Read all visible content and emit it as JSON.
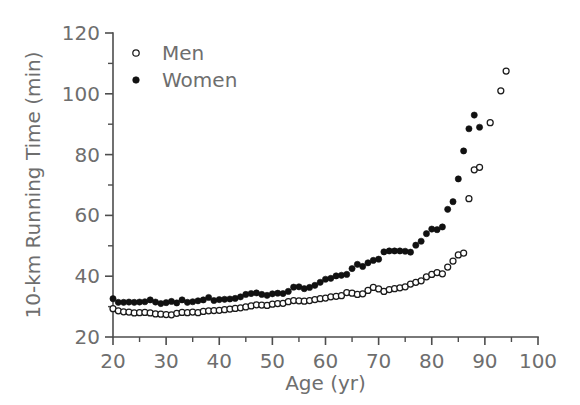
{
  "figure": {
    "background_color": "#ffffff",
    "axis_color": "#4d4d4d",
    "text_color": "#6e6e6e",
    "marker_color": "#111111"
  },
  "chart_data": {
    "type": "scatter",
    "title": "",
    "xlabel": "Age  (yr)",
    "ylabel": "10-km Running Time  (min)",
    "xlim": [
      20,
      100
    ],
    "ylim": [
      20,
      120
    ],
    "xticks": [
      20,
      30,
      40,
      50,
      60,
      70,
      80,
      90,
      100
    ],
    "yticks": [
      20,
      40,
      60,
      80,
      100,
      120
    ],
    "xtick_labels": [
      "20",
      "30",
      "40",
      "50",
      "60",
      "70",
      "80",
      "90",
      "100"
    ],
    "ytick_labels": [
      "20",
      "40",
      "60",
      "80",
      "100",
      "120"
    ],
    "x_minor_ticks": [
      25,
      35,
      45,
      55,
      65,
      75,
      85,
      95
    ],
    "y_minor_ticks": [
      30,
      50,
      70,
      90,
      110
    ],
    "grid": false,
    "legend_position": "upper left",
    "series": [
      {
        "name": "Men",
        "marker": "open-circle",
        "color": "#111111",
        "points": [
          [
            20,
            29.3
          ],
          [
            21,
            28.6
          ],
          [
            22,
            28.3
          ],
          [
            23,
            28.2
          ],
          [
            24,
            27.9
          ],
          [
            25,
            28.0
          ],
          [
            26,
            28.1
          ],
          [
            27,
            27.9
          ],
          [
            28,
            27.6
          ],
          [
            29,
            27.5
          ],
          [
            30,
            27.4
          ],
          [
            31,
            27.3
          ],
          [
            32,
            27.8
          ],
          [
            33,
            28.1
          ],
          [
            34,
            28.0
          ],
          [
            35,
            28.2
          ],
          [
            36,
            28.0
          ],
          [
            37,
            28.4
          ],
          [
            38,
            28.6
          ],
          [
            39,
            28.7
          ],
          [
            40,
            28.8
          ],
          [
            41,
            29.0
          ],
          [
            42,
            29.2
          ],
          [
            43,
            29.4
          ],
          [
            44,
            29.6
          ],
          [
            45,
            29.9
          ],
          [
            46,
            30.2
          ],
          [
            47,
            30.6
          ],
          [
            48,
            30.5
          ],
          [
            49,
            30.4
          ],
          [
            50,
            30.8
          ],
          [
            51,
            31.0
          ],
          [
            52,
            31.1
          ],
          [
            53,
            31.6
          ],
          [
            54,
            32.0
          ],
          [
            55,
            31.9
          ],
          [
            56,
            31.8
          ],
          [
            57,
            32.0
          ],
          [
            58,
            32.3
          ],
          [
            59,
            32.6
          ],
          [
            60,
            32.8
          ],
          [
            61,
            33.2
          ],
          [
            62,
            33.4
          ],
          [
            63,
            33.6
          ],
          [
            64,
            34.6
          ],
          [
            65,
            34.4
          ],
          [
            66,
            34.0
          ],
          [
            67,
            34.2
          ],
          [
            68,
            35.3
          ],
          [
            69,
            36.3
          ],
          [
            70,
            35.8
          ],
          [
            71,
            35.0
          ],
          [
            72,
            35.6
          ],
          [
            73,
            35.9
          ],
          [
            74,
            36.2
          ],
          [
            75,
            36.5
          ],
          [
            76,
            37.4
          ],
          [
            77,
            38.0
          ],
          [
            78,
            38.5
          ],
          [
            79,
            39.8
          ],
          [
            80,
            40.6
          ],
          [
            81,
            41.2
          ],
          [
            82,
            40.8
          ],
          [
            83,
            43.0
          ],
          [
            84,
            45.0
          ],
          [
            85,
            47.0
          ],
          [
            86,
            47.6
          ],
          [
            87,
            65.5
          ],
          [
            88,
            75.0
          ],
          [
            89,
            75.8
          ],
          [
            91,
            90.5
          ],
          [
            93,
            101.0
          ],
          [
            94,
            107.5
          ]
        ]
      },
      {
        "name": "Women",
        "marker": "filled-circle",
        "color": "#111111",
        "points": [
          [
            20,
            32.6
          ],
          [
            21,
            31.4
          ],
          [
            22,
            31.4
          ],
          [
            23,
            31.5
          ],
          [
            24,
            31.4
          ],
          [
            25,
            31.5
          ],
          [
            26,
            31.6
          ],
          [
            27,
            32.2
          ],
          [
            28,
            31.5
          ],
          [
            29,
            31.0
          ],
          [
            30,
            31.3
          ],
          [
            31,
            31.7
          ],
          [
            32,
            31.2
          ],
          [
            33,
            32.2
          ],
          [
            34,
            31.4
          ],
          [
            35,
            31.6
          ],
          [
            36,
            31.9
          ],
          [
            37,
            32.2
          ],
          [
            38,
            33.0
          ],
          [
            39,
            32.0
          ],
          [
            40,
            32.3
          ],
          [
            41,
            32.4
          ],
          [
            42,
            32.5
          ],
          [
            43,
            32.7
          ],
          [
            44,
            33.2
          ],
          [
            45,
            34.0
          ],
          [
            46,
            34.3
          ],
          [
            47,
            34.5
          ],
          [
            48,
            34.0
          ],
          [
            49,
            33.7
          ],
          [
            50,
            34.2
          ],
          [
            51,
            34.4
          ],
          [
            52,
            34.3
          ],
          [
            53,
            35.0
          ],
          [
            54,
            36.4
          ],
          [
            55,
            36.5
          ],
          [
            56,
            35.9
          ],
          [
            57,
            36.3
          ],
          [
            58,
            37.0
          ],
          [
            59,
            38.0
          ],
          [
            60,
            39.0
          ],
          [
            61,
            39.3
          ],
          [
            62,
            40.1
          ],
          [
            63,
            40.3
          ],
          [
            64,
            40.6
          ],
          [
            65,
            42.5
          ],
          [
            66,
            43.9
          ],
          [
            67,
            43.2
          ],
          [
            68,
            44.4
          ],
          [
            69,
            45.2
          ],
          [
            70,
            45.6
          ],
          [
            71,
            48.0
          ],
          [
            72,
            48.3
          ],
          [
            73,
            48.3
          ],
          [
            74,
            48.3
          ],
          [
            75,
            48.2
          ],
          [
            76,
            47.9
          ],
          [
            77,
            50.2
          ],
          [
            78,
            51.5
          ],
          [
            79,
            54.0
          ],
          [
            80,
            55.5
          ],
          [
            81,
            55.3
          ],
          [
            82,
            56.2
          ],
          [
            83,
            62.0
          ],
          [
            84,
            64.5
          ],
          [
            85,
            72.0
          ],
          [
            86,
            81.2
          ],
          [
            87,
            88.5
          ],
          [
            88,
            93.0
          ],
          [
            89,
            89.0
          ]
        ]
      }
    ]
  },
  "legend": {
    "entries": [
      {
        "label": "Men",
        "marker": "open-circle"
      },
      {
        "label": "Women",
        "marker": "filled-circle"
      }
    ]
  }
}
